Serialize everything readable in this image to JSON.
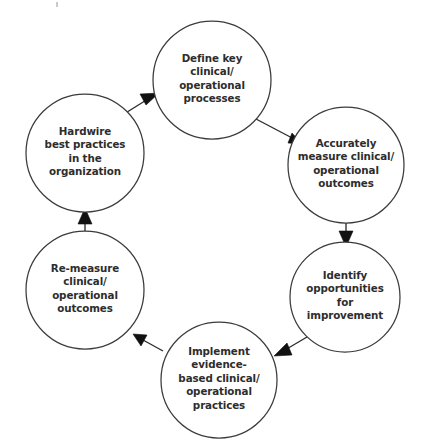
{
  "diagram": {
    "type": "cycle",
    "direction": "clockwise",
    "stroke_color": "#3b3b3b",
    "arrow_color": "#111111",
    "text_color": "#2d2d2d",
    "background": "#ffffff",
    "nodes": [
      {
        "id": "define-key-processes",
        "order": 1,
        "cx": 212,
        "cy": 80,
        "r": 59,
        "lines": [
          "Define key",
          "clinical/",
          "operational",
          "processes"
        ]
      },
      {
        "id": "accurately-measure-outcomes",
        "order": 2,
        "cx": 346,
        "cy": 165,
        "r": 58,
        "lines": [
          "Accurately",
          "measure clinical/",
          "operational",
          "outcomes"
        ]
      },
      {
        "id": "identify-opportunities",
        "order": 3,
        "cx": 345,
        "cy": 297,
        "r": 55,
        "lines": [
          "Identify",
          "opportunities",
          "for",
          "improvement"
        ]
      },
      {
        "id": "implement-evidence-based-practices",
        "order": 4,
        "cx": 219,
        "cy": 380,
        "r": 58,
        "lines": [
          "Implement",
          "evidence-",
          "based clinical/",
          "operational",
          "practices"
        ]
      },
      {
        "id": "re-measure-outcomes",
        "order": 5,
        "cx": 85,
        "cy": 290,
        "r": 59,
        "lines": [
          "Re-measure",
          "clinical/",
          "operational",
          "outcomes"
        ]
      },
      {
        "id": "hardwire-best-practices",
        "order": 6,
        "cx": 85,
        "cy": 153,
        "r": 59,
        "lines": [
          "Hardwire",
          "best practices",
          "in the",
          "organization"
        ]
      }
    ],
    "connectors": [
      {
        "id": "define-to-measure",
        "from": "define-key-processes",
        "to": "accurately-measure-outcomes"
      },
      {
        "id": "measure-to-identify",
        "from": "accurately-measure-outcomes",
        "to": "identify-opportunities"
      },
      {
        "id": "identify-to-implement",
        "from": "identify-opportunities",
        "to": "implement-evidence-based-practices"
      },
      {
        "id": "implement-to-remeasure",
        "from": "implement-evidence-based-practices",
        "to": "re-measure-outcomes"
      },
      {
        "id": "remeasure-to-hardwire",
        "from": "re-measure-outcomes",
        "to": "hardwire-best-practices"
      },
      {
        "id": "hardwire-to-define",
        "from": "hardwire-best-practices",
        "to": "define-key-processes"
      }
    ]
  }
}
